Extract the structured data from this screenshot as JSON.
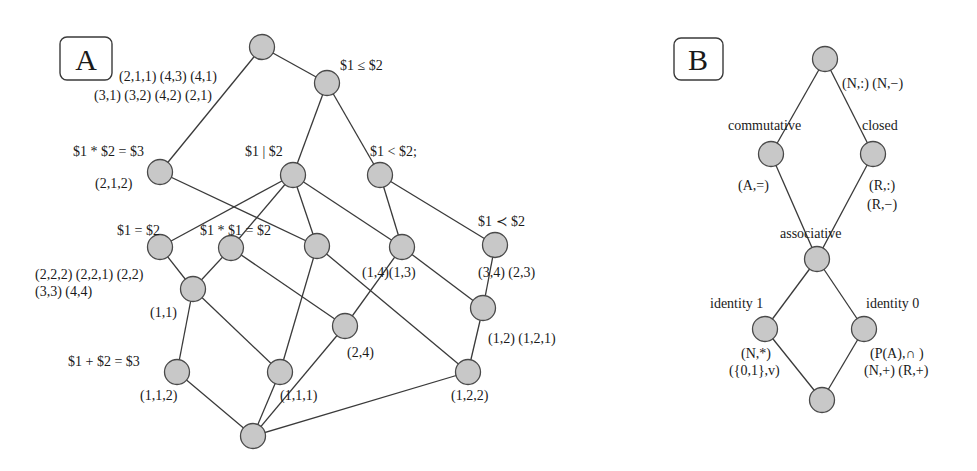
{
  "panels": {
    "A": {
      "letter": "A",
      "labels": {
        "top_left_1": "(2,1,1) (4,3) (4,1)",
        "top_left_2": "(3,1) (3,2) (4,2) (2,1)",
        "leq": "$1 ≤ $2",
        "mul3": "$1 * $2 = $3",
        "n212": "(2,1,2)",
        "divides": "$1 | $2",
        "lt": "$1 < $2;",
        "eq": "$1 = $2",
        "sq": "$1 * $1 = $2",
        "prec": "$1 ≺ $2",
        "eq_tuples_1": "(2,2,2) (2,2,1) (2,2)",
        "eq_tuples_2": "(3,3)  (4,4)",
        "n14_13": "(1,4)(1,3)",
        "n34_23": "(3,4)  (2,3)",
        "n11": "(1,1)",
        "n12_121": "(1,2) (1,2,1)",
        "n24": "(2,4)",
        "add3": "$1 + $2 = $3",
        "n112": "(1,1,2)",
        "n111": "(1,1,1)",
        "n122": "(1,2,2)"
      },
      "nodes": [
        {
          "id": "top",
          "x": 262,
          "y": 47
        },
        {
          "id": "leq",
          "x": 327,
          "y": 83
        },
        {
          "id": "mul3",
          "x": 160,
          "y": 172
        },
        {
          "id": "divides",
          "x": 293,
          "y": 175
        },
        {
          "id": "lt",
          "x": 380,
          "y": 175
        },
        {
          "id": "eq",
          "x": 160,
          "y": 247
        },
        {
          "id": "sq",
          "x": 231,
          "y": 248
        },
        {
          "id": "mid",
          "x": 317,
          "y": 246
        },
        {
          "id": "n14",
          "x": 402,
          "y": 247
        },
        {
          "id": "prec",
          "x": 495,
          "y": 245
        },
        {
          "id": "n11",
          "x": 193,
          "y": 289
        },
        {
          "id": "n12",
          "x": 483,
          "y": 308
        },
        {
          "id": "n24",
          "x": 345,
          "y": 326
        },
        {
          "id": "n112",
          "x": 177,
          "y": 372
        },
        {
          "id": "n111",
          "x": 280,
          "y": 372
        },
        {
          "id": "n122",
          "x": 468,
          "y": 372
        },
        {
          "id": "bottom",
          "x": 253,
          "y": 436
        }
      ],
      "edges": [
        [
          "top",
          "leq"
        ],
        [
          "top",
          "mul3"
        ],
        [
          "leq",
          "divides"
        ],
        [
          "leq",
          "lt"
        ],
        [
          "mul3",
          "mid"
        ],
        [
          "divides",
          "eq"
        ],
        [
          "divides",
          "sq"
        ],
        [
          "divides",
          "mid"
        ],
        [
          "divides",
          "n14"
        ],
        [
          "lt",
          "n14"
        ],
        [
          "lt",
          "prec"
        ],
        [
          "eq",
          "n11"
        ],
        [
          "sq",
          "n11"
        ],
        [
          "sq",
          "n24"
        ],
        [
          "mid",
          "n111"
        ],
        [
          "mid",
          "n122"
        ],
        [
          "n14",
          "n24"
        ],
        [
          "n14",
          "n12"
        ],
        [
          "prec",
          "n12"
        ],
        [
          "n11",
          "n112"
        ],
        [
          "n11",
          "n111"
        ],
        [
          "n12",
          "n122"
        ],
        [
          "bottom",
          "n112"
        ],
        [
          "bottom",
          "n111"
        ],
        [
          "bottom",
          "n24"
        ],
        [
          "bottom",
          "n122"
        ]
      ]
    },
    "B": {
      "letter": "B",
      "labels": {
        "top_tuples": "(N,:) (N,−)",
        "commutative": "commutative",
        "closed": "closed",
        "a_eq": "(A,=)",
        "r_colon": "(R,:)",
        "r_minus": "(R,−)",
        "associative": "associative",
        "identity1": "identity 1",
        "identity0": "identity 0",
        "n_star": "(N,*)",
        "set01_v": "({0,1},v)",
        "pa_cap": "(P(A),∩ )",
        "n_plus_r_plus": "(N,+)  (R,+)"
      },
      "nodes": [
        {
          "id": "top",
          "x": 825,
          "y": 59
        },
        {
          "id": "commutative",
          "x": 771,
          "y": 154
        },
        {
          "id": "closed",
          "x": 873,
          "y": 154
        },
        {
          "id": "associative",
          "x": 817,
          "y": 259
        },
        {
          "id": "identity1",
          "x": 765,
          "y": 329
        },
        {
          "id": "identity0",
          "x": 864,
          "y": 329
        },
        {
          "id": "bottom",
          "x": 822,
          "y": 400
        }
      ],
      "edges": [
        [
          "top",
          "commutative"
        ],
        [
          "top",
          "closed"
        ],
        [
          "commutative",
          "associative"
        ],
        [
          "closed",
          "associative"
        ],
        [
          "associative",
          "identity1"
        ],
        [
          "associative",
          "identity0"
        ],
        [
          "identity1",
          "bottom"
        ],
        [
          "identity0",
          "bottom"
        ]
      ]
    }
  },
  "colors": {
    "node_fill": "#c8c8c8",
    "node_stroke": "#4a4a4a",
    "edge": "#3a3a3a",
    "text": "#1a1a1a"
  }
}
